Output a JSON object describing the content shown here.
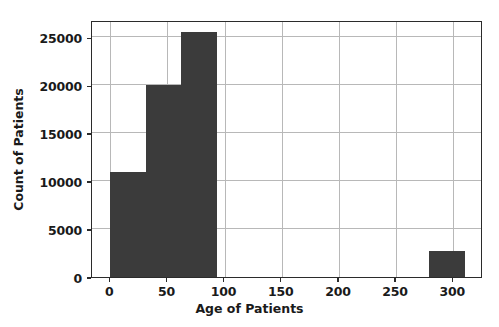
{
  "chart_data": {
    "type": "bar",
    "subtype": "histogram",
    "title": "",
    "xlabel": "Age of Patients",
    "ylabel": "Count of Patients",
    "xlim": [
      -16,
      326
    ],
    "ylim": [
      0,
      26800
    ],
    "grid": true,
    "legend": null,
    "bar_color": "#3b3b3b",
    "bin_edges": [
      0,
      31,
      62,
      93,
      124,
      155,
      186,
      217,
      248,
      279,
      310
    ],
    "bin_labels": [
      "0-31",
      "31-62",
      "62-93",
      "93-124",
      "124-155",
      "155-186",
      "186-217",
      "217-248",
      "248-279",
      "279-310"
    ],
    "values": [
      11000,
      20000,
      25600,
      0,
      0,
      0,
      0,
      0,
      0,
      2700
    ],
    "xticks": [
      0,
      50,
      100,
      150,
      200,
      250,
      300
    ],
    "xtick_labels": [
      "0",
      "50",
      "100",
      "150",
      "200",
      "250",
      "300"
    ],
    "yticks": [
      0,
      5000,
      10000,
      15000,
      20000,
      25000
    ],
    "ytick_labels": [
      "0",
      "5000",
      "10000",
      "15000",
      "20000",
      "25000"
    ]
  }
}
